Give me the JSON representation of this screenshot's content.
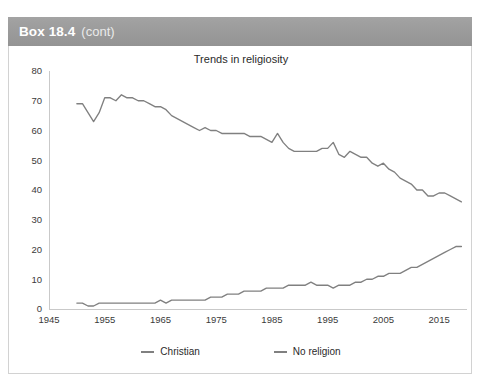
{
  "box": {
    "title": "Box 18.4",
    "continued": "(cont)",
    "header_color": "#9d9d9d"
  },
  "chart_data": {
    "type": "line",
    "title": "Trends in religiosity",
    "xlabel": "",
    "ylabel": "",
    "xlim": [
      1945,
      2020
    ],
    "ylim": [
      0,
      80
    ],
    "xticks": [
      1945,
      1955,
      1965,
      1975,
      1985,
      1995,
      2005,
      2015
    ],
    "yticks": [
      0,
      10,
      20,
      30,
      40,
      50,
      60,
      70,
      80
    ],
    "grid": false,
    "legend_position": "bottom",
    "line_color": "#808080",
    "x": [
      1950,
      1951,
      1952,
      1953,
      1954,
      1955,
      1956,
      1957,
      1958,
      1959,
      1960,
      1961,
      1962,
      1963,
      1964,
      1965,
      1966,
      1967,
      1968,
      1969,
      1970,
      1971,
      1972,
      1973,
      1974,
      1975,
      1976,
      1977,
      1978,
      1979,
      1980,
      1981,
      1982,
      1983,
      1984,
      1985,
      1986,
      1987,
      1988,
      1989,
      1990,
      1991,
      1992,
      1993,
      1994,
      1995,
      1996,
      1997,
      1998,
      1999,
      2000,
      2001,
      2002,
      2003,
      2004,
      2005,
      2006,
      2007,
      2008,
      2009,
      2010,
      2011,
      2012,
      2013,
      2014,
      2015,
      2016,
      2017,
      2018,
      2019
    ],
    "series": [
      {
        "name": "Christian",
        "color": "#808080",
        "values": [
          69,
          69,
          66,
          63,
          66,
          71,
          71,
          70,
          72,
          71,
          71,
          70,
          70,
          69,
          68,
          68,
          67,
          65,
          64,
          63,
          62,
          61,
          60,
          61,
          60,
          60,
          59,
          59,
          59,
          59,
          59,
          58,
          58,
          58,
          57,
          56,
          59,
          56,
          54,
          53,
          53,
          53,
          53,
          53,
          54,
          54,
          56,
          52,
          51,
          53,
          52,
          51,
          51,
          49,
          48,
          49,
          47,
          46,
          44,
          43,
          42,
          40,
          40,
          38,
          38,
          39,
          39,
          38,
          37,
          36
        ]
      },
      {
        "name": "No religion",
        "color": "#808080",
        "values": [
          2,
          2,
          1,
          1,
          2,
          2,
          2,
          2,
          2,
          2,
          2,
          2,
          2,
          2,
          2,
          3,
          2,
          3,
          3,
          3,
          3,
          3,
          3,
          3,
          4,
          4,
          4,
          5,
          5,
          5,
          6,
          6,
          6,
          6,
          7,
          7,
          7,
          7,
          8,
          8,
          8,
          8,
          9,
          8,
          8,
          8,
          7,
          8,
          8,
          8,
          9,
          9,
          10,
          10,
          11,
          11,
          12,
          12,
          12,
          13,
          14,
          14,
          15,
          16,
          17,
          18,
          19,
          20,
          21,
          21
        ]
      }
    ]
  },
  "legend": {
    "items": [
      {
        "label": "Christian"
      },
      {
        "label": "No religion"
      }
    ]
  }
}
